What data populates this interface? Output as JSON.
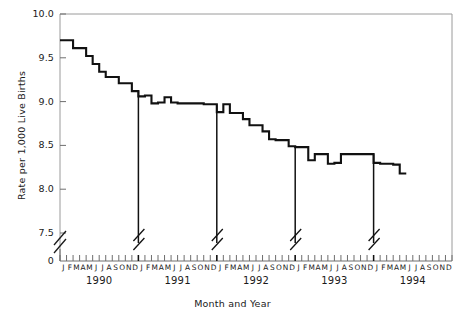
{
  "figure": {
    "cut_title_fragment": "",
    "axis_titles": {
      "x": "Month and Year",
      "y": "Rate per 1,000 Live Births"
    }
  },
  "chart_data": {
    "type": "line",
    "title": "",
    "subtitle": "",
    "xlabel": "Month and Year",
    "ylabel": "Rate per 1,000 Live Births",
    "ylim": [
      7.5,
      10.0
    ],
    "yticks": [
      "10.0",
      "9.5",
      "9.0",
      "8.5",
      "8.0",
      "7.5",
      "0"
    ],
    "ytick_values": [
      10.0,
      9.5,
      9.0,
      8.5,
      8.0,
      7.5,
      0
    ],
    "y_axis_break": true,
    "y_axis_break_note": "Scale broken between 0 and 7.5",
    "grid": false,
    "legend": null,
    "month_labels": [
      "J",
      "F",
      "M",
      "A",
      "M",
      "J",
      "J",
      "A",
      "S",
      "O",
      "N",
      "D"
    ],
    "years": [
      "1990",
      "1991",
      "1992",
      "1993",
      "1994"
    ],
    "year_divider_breaks": [
      "1990-D",
      "1991-D",
      "1992-D",
      "1993-D"
    ],
    "series": [
      {
        "name": "Infant mortality rate",
        "x": [
          "1990-J",
          "1990-F",
          "1990-M",
          "1990-A",
          "1990-M",
          "1990-J",
          "1990-J",
          "1990-A",
          "1990-S",
          "1990-O",
          "1990-N",
          "1990-D",
          "1991-J",
          "1991-F",
          "1991-M",
          "1991-A",
          "1991-M",
          "1991-J",
          "1991-J",
          "1991-A",
          "1991-S",
          "1991-O",
          "1991-N",
          "1991-D",
          "1992-J",
          "1992-F",
          "1992-M",
          "1992-A",
          "1992-M",
          "1992-J",
          "1992-J",
          "1992-A",
          "1992-S",
          "1992-O",
          "1992-N",
          "1992-D",
          "1993-J",
          "1993-F",
          "1993-M",
          "1993-A",
          "1993-M",
          "1993-J",
          "1993-J",
          "1993-A",
          "1993-S",
          "1993-O",
          "1993-N",
          "1993-D",
          "1994-J",
          "1994-F",
          "1994-M",
          "1994-A",
          "1994-M"
        ],
        "values": [
          9.7,
          9.7,
          9.61,
          9.61,
          9.52,
          9.43,
          9.34,
          9.28,
          9.28,
          9.21,
          9.21,
          9.12,
          9.06,
          9.07,
          8.98,
          8.99,
          9.05,
          8.99,
          8.98,
          8.98,
          8.98,
          8.98,
          8.97,
          8.97,
          8.88,
          8.97,
          8.87,
          8.87,
          8.8,
          8.73,
          8.73,
          8.66,
          8.57,
          8.56,
          8.56,
          8.49,
          8.48,
          8.48,
          8.33,
          8.4,
          8.4,
          8.29,
          8.3,
          8.4,
          8.4,
          8.4,
          8.4,
          8.4,
          8.3,
          8.29,
          8.29,
          8.28,
          8.18
        ]
      }
    ]
  }
}
